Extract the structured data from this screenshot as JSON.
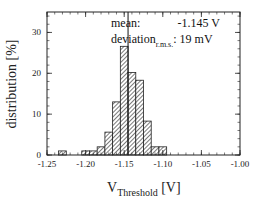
{
  "chart_data": {
    "type": "bar",
    "subtype": "histogram",
    "title": "",
    "xlabel": "V_Threshold [V]",
    "xlabel_main": "V",
    "xlabel_sub": "Threshold",
    "xlabel_unit": " [V]",
    "ylabel": "distribution [%]",
    "xlim": [
      -1.25,
      -1.0
    ],
    "ylim": [
      0,
      35
    ],
    "bin_width": 0.01,
    "x_ticks": [
      -1.25,
      -1.2,
      -1.15,
      -1.1,
      -1.05,
      -1.0
    ],
    "x_tick_labels": [
      "-1.25",
      "-1.20",
      "-1.15",
      "-1.10",
      "-1.05",
      "-1.00"
    ],
    "y_ticks": [
      0,
      10,
      20,
      30
    ],
    "y_tick_labels": [
      "0",
      "10",
      "20",
      "30"
    ],
    "categories": [
      -1.23,
      -1.2,
      -1.19,
      -1.18,
      -1.17,
      -1.16,
      -1.15,
      -1.14,
      -1.13,
      -1.12,
      -1.11,
      -1.1
    ],
    "values": [
      1,
      1,
      1,
      2,
      5.6,
      13,
      26.6,
      20.2,
      18.3,
      8.3,
      2,
      2
    ],
    "grid": false,
    "legend": null,
    "bar_fill": "diagonal hatch",
    "annotations": {
      "mean_label": "mean:",
      "mean_value": "-1.145 V",
      "deviation_label": "deviation",
      "deviation_sub": "r.m.s.",
      "deviation_value": ": 19 mV",
      "mean_line_x": -1.145
    }
  }
}
